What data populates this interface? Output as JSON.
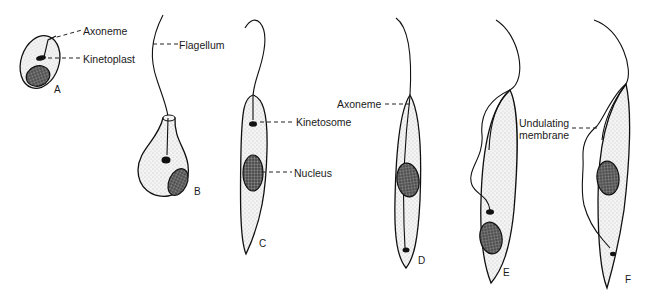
{
  "figure": {
    "type": "diagram",
    "stages": [
      {
        "id": "A",
        "label": "A"
      },
      {
        "id": "B",
        "label": "B"
      },
      {
        "id": "C",
        "label": "C"
      },
      {
        "id": "D",
        "label": "D"
      },
      {
        "id": "E",
        "label": "E"
      },
      {
        "id": "F",
        "label": "F"
      }
    ],
    "labels": {
      "axoneme_a": "Axoneme",
      "kinetoplast": "Kinetoplast",
      "flagellum": "Flagellum",
      "kinetosome": "Kinetosome",
      "nucleus": "Nucleus",
      "axoneme_d": "Axoneme",
      "undulating_membrane_line1": "Undulating",
      "undulating_membrane_line2": "membrane"
    }
  }
}
